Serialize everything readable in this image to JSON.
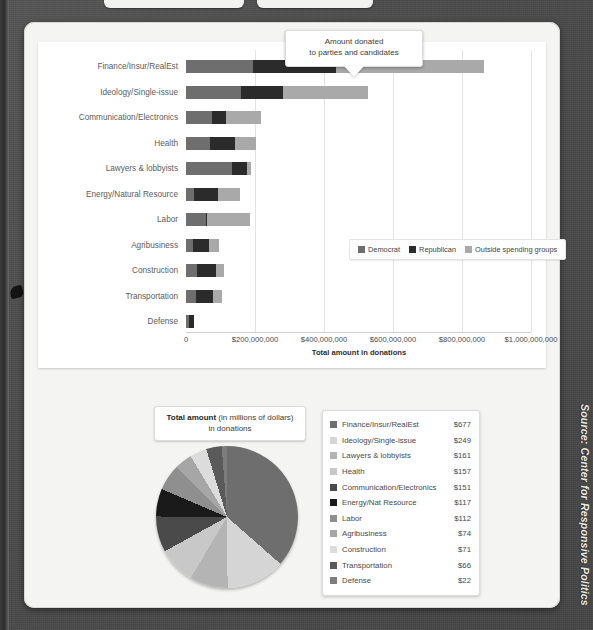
{
  "source_note": "Source: Center for Responsive Politics",
  "callout": {
    "line1": "Amount donated",
    "line2": "to parties and candidates"
  },
  "bar_chart": {
    "axis_title": "Total amount in donations",
    "legend": [
      {
        "label": "Democrat",
        "color": "#6e6e6e"
      },
      {
        "label": "Republican",
        "color": "#2b2b2b"
      },
      {
        "label": "Outside spending groups",
        "color": "#a9a9a9"
      }
    ],
    "ticks": [
      "0",
      "$200,000,000",
      "$400,000,000",
      "$600,000,000",
      "$800,000,000",
      "$1,000,000,000"
    ]
  },
  "pie_title": {
    "strong": "Total amount",
    "rest": "(in millions of dollars)",
    "line2": "in donations"
  },
  "pie_legend": [
    {
      "label": "Finance/Insur/RealEst",
      "value": "$677",
      "color": "#6e6e6e"
    },
    {
      "label": "Ideology/Single-issue",
      "value": "$249",
      "color": "#d5d5d5"
    },
    {
      "label": "Lawyers & lobbyists",
      "value": "$161",
      "color": "#b4b4b4"
    },
    {
      "label": "Health",
      "value": "$157",
      "color": "#c8c8c8"
    },
    {
      "label": "Communication/Electronics",
      "value": "$151",
      "color": "#4a4a4a"
    },
    {
      "label": "Energy/Nat Resource",
      "value": "$117",
      "color": "#1a1a1a"
    },
    {
      "label": "Labor",
      "value": "$112",
      "color": "#8f8f8f"
    },
    {
      "label": "Agribusiness",
      "value": "$74",
      "color": "#a6a6a6"
    },
    {
      "label": "Construction",
      "value": "$71",
      "color": "#dcdcdc"
    },
    {
      "label": "Transportation",
      "value": "$66",
      "color": "#5a5a5a"
    },
    {
      "label": "Defense",
      "value": "$22",
      "color": "#7d7d7d"
    }
  ],
  "chart_data": [
    {
      "type": "bar",
      "orientation": "horizontal",
      "stacked": true,
      "title": "Amount donated to parties and candidates",
      "xlabel": "Total amount in donations",
      "ylabel": "",
      "xlim": [
        0,
        1000000000
      ],
      "xticks": [
        0,
        200000000,
        400000000,
        600000000,
        800000000,
        1000000000
      ],
      "xticklabels": [
        "0",
        "$200,000,000",
        "$400,000,000",
        "$600,000,000",
        "$800,000,000",
        "$1,000,000,000"
      ],
      "grid": true,
      "legend_position": "inside-right",
      "categories": [
        "Finance/Insur/RealEst",
        "Ideology/Single-issue",
        "Communication/Electronics",
        "Health",
        "Lawyers & lobbyists",
        "Energy/Natural Resource",
        "Labor",
        "Agribusiness",
        "Construction",
        "Transportation",
        "Defense"
      ],
      "series": [
        {
          "name": "Democrat",
          "color": "#6e6e6e",
          "values": [
            195000000,
            160000000,
            75000000,
            70000000,
            133000000,
            22000000,
            58000000,
            19000000,
            33000000,
            28000000,
            8000000
          ]
        },
        {
          "name": "Republican",
          "color": "#2b2b2b",
          "values": [
            240000000,
            120000000,
            40000000,
            72000000,
            45000000,
            70000000,
            4000000,
            47000000,
            53000000,
            50000000,
            14000000
          ]
        },
        {
          "name": "Outside spending groups",
          "color": "#a9a9a9",
          "values": [
            430000000,
            247000000,
            103000000,
            62000000,
            11000000,
            64000000,
            123000000,
            29000000,
            23000000,
            25000000,
            0
          ]
        }
      ]
    },
    {
      "type": "pie",
      "title": "Total amount (in millions of dollars) in donations",
      "unit": "millions of dollars",
      "labels": [
        "Finance/Insur/RealEst",
        "Ideology/Single-issue",
        "Lawyers & lobbyists",
        "Health",
        "Communication/Electronics",
        "Energy/Nat Resource",
        "Labor",
        "Agribusiness",
        "Construction",
        "Transportation",
        "Defense"
      ],
      "values": [
        677,
        249,
        161,
        157,
        151,
        117,
        112,
        74,
        71,
        66,
        22
      ],
      "colors": [
        "#6e6e6e",
        "#d5d5d5",
        "#b4b4b4",
        "#c8c8c8",
        "#4a4a4a",
        "#1a1a1a",
        "#8f8f8f",
        "#a6a6a6",
        "#dcdcdc",
        "#5a5a5a",
        "#7d7d7d"
      ],
      "legend_position": "right",
      "start_angle": 0,
      "direction": "clockwise"
    }
  ]
}
